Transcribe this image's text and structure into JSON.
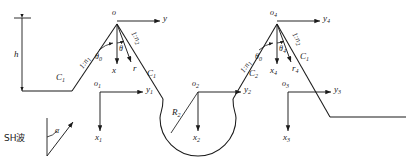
{
  "figure": {
    "type": "engineering-cross-section-diagram",
    "stroke_color": "#1a1a1a",
    "background": "#ffffff"
  },
  "labels": {
    "height_h": "h",
    "wave_source": "SH波",
    "incidence_angle": "α",
    "apex_left_origin": "o",
    "apex_left_axis_y": "y",
    "apex_left_axis_x": "x",
    "apex_left_radial_r": "r",
    "apex_left_theta0": "θ",
    "apex_left_theta0_sub": "0",
    "apex_left_theta": "θ",
    "slope_left_1": "1:n",
    "slope_left_1_sub": "1",
    "slope_right_1": "1:n",
    "slope_right_1_sub": "2",
    "curve_c1_left": "C",
    "curve_c1_left_sub": "1",
    "curve_c1_mid": "C",
    "curve_c1_mid_sub": "1",
    "curve_c2_mid": "C",
    "curve_c2_mid_sub": "2",
    "curve_c2_right": "C",
    "curve_c2_right_sub": "1",
    "radius_r2": "R",
    "radius_r2_sub": "2",
    "origin_1": "o",
    "origin_1_sub": "1",
    "axis_y1": "y",
    "axis_y1_sub": "1",
    "axis_x1": "x",
    "axis_x1_sub": "1",
    "origin_2": "o",
    "origin_2_sub": "2",
    "axis_y2": "y",
    "axis_y2_sub": "2",
    "axis_x2": "x",
    "axis_x2_sub": "2",
    "origin_3": "o",
    "origin_3_sub": "3",
    "axis_y3": "y",
    "axis_y3_sub": "3",
    "axis_x3": "x",
    "axis_x3_sub": "3",
    "origin_4": "o",
    "origin_4_sub": "4",
    "axis_y4": "y",
    "axis_y4_sub": "4",
    "axis_x4": "x",
    "axis_x4_sub": "4",
    "radial_r4": "r",
    "radial_r4_sub": "4",
    "apex_right_theta0": "θ",
    "apex_right_theta0_sub": "0",
    "apex_right_theta4": "θ",
    "apex_right_theta4_sub": "4",
    "slope_left_2": "1:n",
    "slope_left_2_sub": "1",
    "slope_right_2": "1:n",
    "slope_right_2_sub": "2"
  }
}
